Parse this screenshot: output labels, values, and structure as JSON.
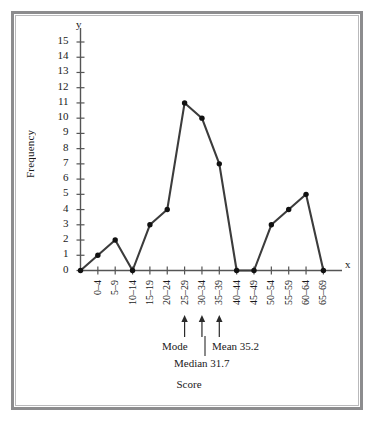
{
  "figure": {
    "frame_color": "#8c8c8e",
    "background": "#ffffff",
    "line_color": "#3c3c3c",
    "marker_color": "#111111",
    "axis_color": "#555555"
  },
  "axes": {
    "y_letter": "y",
    "x_letter": "x",
    "ylabel": "Frequency",
    "xlabel": "Score",
    "y_ticks": [
      "0",
      "1",
      "2",
      "3",
      "4",
      "5",
      "6",
      "7",
      "8",
      "9",
      "10",
      "11",
      "12",
      "13",
      "14",
      "15"
    ]
  },
  "annotations": {
    "mode": "Mode",
    "mean": "Mean 35.2",
    "median": "Median 31.7",
    "arrow_targets": [
      "25-29",
      "30-34",
      "35-39"
    ]
  },
  "chart_data": {
    "type": "line",
    "title": "",
    "subtitle": "",
    "xlabel": "Score",
    "ylabel": "Frequency",
    "categories": [
      "0–4",
      "5–9",
      "10–14",
      "15–19",
      "20–24",
      "25–29",
      "30–34",
      "35–39",
      "40–44",
      "45–49",
      "50–54",
      "55–59",
      "60–64",
      "65–69"
    ],
    "values": [
      1,
      2,
      0,
      3,
      4,
      11,
      10,
      7,
      0,
      0,
      3,
      4,
      5,
      0
    ],
    "origin_value": 0,
    "ylim": [
      0,
      15
    ],
    "ytick_step": 1,
    "grid": false,
    "legend": null,
    "markers": "filled-circle",
    "statistics": {
      "mean": 35.2,
      "median": 31.7,
      "mode_class": "25–29"
    }
  }
}
